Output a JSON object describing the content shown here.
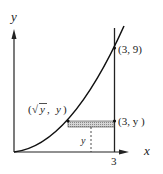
{
  "diagram": {
    "axes": {
      "x_label": "y",
      "x_axis_label": "x",
      "y_axis_label": "y"
    },
    "labels": {
      "top_point": "(3, 9)",
      "left_point_open": "(",
      "left_point_sqrt": "√",
      "left_point_rest": "y, y)",
      "left_point_var": "y",
      "right_point": "(3, y )",
      "x_tick": "3",
      "strip_height_label": "y"
    },
    "curve": "y = x^2",
    "vertical_line": "x = 3",
    "colors": {
      "stroke": "#222222",
      "shade": "#bdbdbd"
    }
  }
}
